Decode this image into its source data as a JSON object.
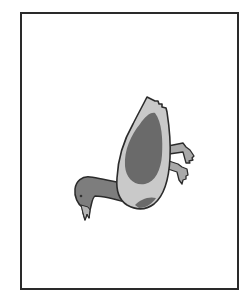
{
  "image": {
    "subject": "duck diving head-down illustration",
    "colors": {
      "background": "#ffffff",
      "frame_border": "#2a2a2a",
      "outline": "#2b2b2b",
      "body_light": "#c9c9c9",
      "wing_dark": "#6a6a6a",
      "head_neck": "#7d7d7d",
      "feet": "#a9a9a9",
      "eye": "#333333"
    }
  }
}
